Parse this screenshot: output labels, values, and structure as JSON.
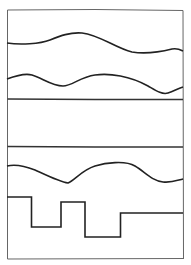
{
  "diagram": {
    "stroke_color": "#222222",
    "frame_color": "#555555",
    "background": "#ffffff",
    "panels": [
      {
        "name": "top-panel",
        "content": [
          "smooth-wave",
          "smooth-wave"
        ]
      },
      {
        "name": "empty-panel",
        "content": []
      },
      {
        "name": "bottom-panel",
        "content": [
          "smooth-wave",
          "square-wave"
        ]
      }
    ],
    "square_wave": {
      "levels": [
        "high",
        "low",
        "high",
        "low",
        "mid"
      ]
    }
  }
}
